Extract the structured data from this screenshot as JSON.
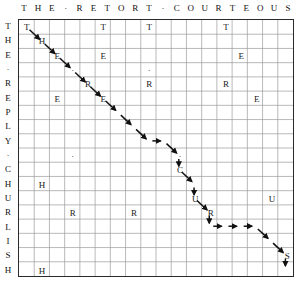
{
  "figure": {
    "kind": "alignment-matrix",
    "top_header": {
      "text": "THE · RETORT · COURTEOUS",
      "letters": [
        "T",
        "H",
        "E",
        "·",
        "R",
        "E",
        "T",
        "O",
        "R",
        "T",
        "·",
        "C",
        "O",
        "U",
        "R",
        "T",
        "E",
        "O",
        "U",
        "S"
      ]
    },
    "left_header": {
      "text": "THE · REPLY · CHURLISH",
      "letters": [
        "T",
        "H",
        "E",
        "·",
        "R",
        "E",
        "P",
        "L",
        "Y",
        "·",
        "C",
        "H",
        "U",
        "R",
        "L",
        "I",
        "S",
        "H"
      ]
    },
    "grid": {
      "cols": 18,
      "rows": 18,
      "cell_w": 15.33,
      "cell_h": 14.33
    },
    "colors": {
      "border": "#2a2a2a",
      "gridline": "#9a9a9a",
      "letter": "#1a1a1a",
      "path": "#111111"
    },
    "cells": [
      {
        "c": 0,
        "r": 0,
        "ch": "T"
      },
      {
        "c": 5,
        "r": 0,
        "ch": "T"
      },
      {
        "c": 8,
        "r": 0,
        "ch": "T"
      },
      {
        "c": 13,
        "r": 0,
        "ch": "T"
      },
      {
        "c": 1,
        "r": 1,
        "ch": "H"
      },
      {
        "c": 2,
        "r": 2,
        "ch": "E"
      },
      {
        "c": 5,
        "r": 2,
        "ch": "E"
      },
      {
        "c": 14,
        "r": 2,
        "ch": "E"
      },
      {
        "c": 3,
        "r": 3,
        "ch": "·"
      },
      {
        "c": 8,
        "r": 3,
        "ch": "·"
      },
      {
        "c": 4,
        "r": 4,
        "ch": "R"
      },
      {
        "c": 8,
        "r": 4,
        "ch": "R"
      },
      {
        "c": 13,
        "r": 4,
        "ch": "R"
      },
      {
        "c": 2,
        "r": 5,
        "ch": "E"
      },
      {
        "c": 5,
        "r": 5,
        "ch": "E"
      },
      {
        "c": 15,
        "r": 5,
        "ch": "E"
      },
      {
        "c": 3,
        "r": 9,
        "ch": "·"
      },
      {
        "c": 10,
        "r": 9,
        "ch": "·"
      },
      {
        "c": 10,
        "r": 10,
        "ch": "C"
      },
      {
        "c": 1,
        "r": 11,
        "ch": "H"
      },
      {
        "c": 11,
        "r": 12,
        "ch": "U"
      },
      {
        "c": 16,
        "r": 12,
        "ch": "U"
      },
      {
        "c": 3,
        "r": 13,
        "ch": "R"
      },
      {
        "c": 7,
        "r": 13,
        "ch": "R"
      },
      {
        "c": 12,
        "r": 13,
        "ch": "R"
      },
      {
        "c": 17,
        "r": 16,
        "ch": "S"
      },
      {
        "c": 1,
        "r": 17,
        "ch": "H"
      }
    ],
    "path_arrows": [
      {
        "from_c": 0,
        "from_r": 0,
        "to_c": 1,
        "to_r": 1,
        "type": "diagonal"
      },
      {
        "from_c": 1,
        "from_r": 1,
        "to_c": 2,
        "to_r": 2,
        "type": "diagonal"
      },
      {
        "from_c": 2,
        "from_r": 2,
        "to_c": 3,
        "to_r": 3,
        "type": "diagonal"
      },
      {
        "from_c": 3,
        "from_r": 3,
        "to_c": 4,
        "to_r": 4,
        "type": "diagonal"
      },
      {
        "from_c": 4,
        "from_r": 4,
        "to_c": 5,
        "to_r": 5,
        "type": "diagonal"
      },
      {
        "from_c": 5,
        "from_r": 5,
        "to_c": 6,
        "to_r": 6,
        "type": "diagonal"
      },
      {
        "from_c": 6,
        "from_r": 6,
        "to_c": 7,
        "to_r": 7,
        "type": "diagonal"
      },
      {
        "from_c": 7,
        "from_r": 7,
        "to_c": 8,
        "to_r": 8,
        "type": "diagonal"
      },
      {
        "from_c": 8,
        "from_r": 8,
        "to_c": 9,
        "to_r": 8,
        "type": "horizontal"
      },
      {
        "from_c": 9,
        "from_r": 8,
        "to_c": 10,
        "to_r": 9,
        "type": "diagonal"
      },
      {
        "from_c": 10,
        "from_r": 9,
        "to_c": 10,
        "to_r": 10,
        "type": "diagonal-short"
      },
      {
        "from_c": 10,
        "from_r": 10,
        "to_c": 11,
        "to_r": 11,
        "type": "diagonal"
      },
      {
        "from_c": 11,
        "from_r": 11,
        "to_c": 11,
        "to_r": 12,
        "type": "diagonal-short"
      },
      {
        "from_c": 11,
        "from_r": 12,
        "to_c": 12,
        "to_r": 13,
        "type": "diagonal"
      },
      {
        "from_c": 12,
        "from_r": 13,
        "to_c": 12,
        "to_r": 14,
        "type": "vertical"
      },
      {
        "from_c": 12,
        "from_r": 14,
        "to_c": 13,
        "to_r": 14,
        "type": "horizontal"
      },
      {
        "from_c": 13,
        "from_r": 14,
        "to_c": 14,
        "to_r": 14,
        "type": "horizontal"
      },
      {
        "from_c": 14,
        "from_r": 14,
        "to_c": 15,
        "to_r": 14,
        "type": "horizontal"
      },
      {
        "from_c": 15,
        "from_r": 14,
        "to_c": 16,
        "to_r": 15,
        "type": "diagonal"
      },
      {
        "from_c": 16,
        "from_r": 15,
        "to_c": 17,
        "to_r": 16,
        "type": "diagonal"
      },
      {
        "from_c": 17,
        "from_r": 16,
        "to_c": 17,
        "to_r": 17,
        "type": "vertical"
      }
    ]
  }
}
